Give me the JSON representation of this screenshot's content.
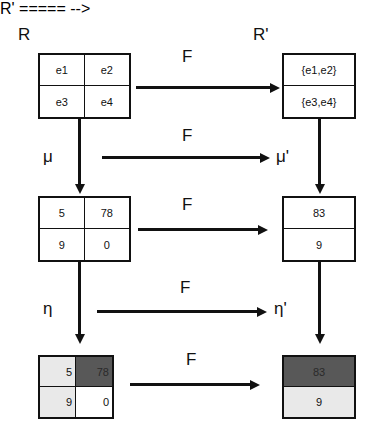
{
  "diagram": {
    "colors": {
      "stroke": "#111111",
      "light_cell": "#e9e9e9",
      "dark_cell": "#585858",
      "background": "#ffffff"
    },
    "corner_labels": {
      "source": "R",
      "target": "R'"
    },
    "functor_labels": [
      {
        "id": "f-top",
        "text": "F"
      },
      {
        "id": "f-mu",
        "text": "F"
      },
      {
        "id": "f-middle",
        "text": "F"
      },
      {
        "id": "f-eta",
        "text": "F"
      },
      {
        "id": "f-bottom",
        "text": "F"
      }
    ],
    "morphism_labels": [
      {
        "id": "mu",
        "text": "μ"
      },
      {
        "id": "mu-prime",
        "text": "μ'"
      },
      {
        "id": "eta",
        "text": "η"
      },
      {
        "id": "eta-prime",
        "text": "η'"
      }
    ],
    "boxes": {
      "top_left": {
        "name": "relation-matrix-R",
        "layout": "2x2",
        "cells": [
          {
            "text": "e1",
            "fill": "white",
            "align": "center"
          },
          {
            "text": "e2",
            "fill": "white",
            "align": "center"
          },
          {
            "text": "e3",
            "fill": "white",
            "align": "center"
          },
          {
            "text": "e4",
            "fill": "white",
            "align": "center"
          }
        ]
      },
      "top_right": {
        "name": "relation-matrix-R-prime",
        "layout": "1x2",
        "cells": [
          {
            "text": "{e1,e2}",
            "fill": "white",
            "align": "center"
          },
          {
            "text": "{e3,e4}",
            "fill": "white",
            "align": "center"
          }
        ]
      },
      "middle_left": {
        "name": "measure-matrix-mu",
        "layout": "2x2",
        "cells": [
          {
            "text": "5",
            "fill": "white",
            "align": "center"
          },
          {
            "text": "78",
            "fill": "white",
            "align": "center"
          },
          {
            "text": "9",
            "fill": "white",
            "align": "center"
          },
          {
            "text": "0",
            "fill": "white",
            "align": "center"
          }
        ]
      },
      "middle_right": {
        "name": "measure-matrix-mu-prime",
        "layout": "1x2",
        "cells": [
          {
            "text": "83",
            "fill": "white",
            "align": "center"
          },
          {
            "text": "9",
            "fill": "white",
            "align": "center"
          }
        ]
      },
      "bottom_left": {
        "name": "shaded-matrix-eta",
        "layout": "2x2",
        "cells": [
          {
            "text": "5",
            "fill": "light",
            "align": "right"
          },
          {
            "text": "78",
            "fill": "dark",
            "align": "right"
          },
          {
            "text": "9",
            "fill": "light",
            "align": "right"
          },
          {
            "text": "0",
            "fill": "white",
            "align": "right"
          }
        ]
      },
      "bottom_right": {
        "name": "shaded-matrix-eta-prime",
        "layout": "1x2",
        "cells": [
          {
            "text": "83",
            "fill": "dark",
            "align": "center"
          },
          {
            "text": "9",
            "fill": "light",
            "align": "center"
          }
        ]
      }
    }
  }
}
